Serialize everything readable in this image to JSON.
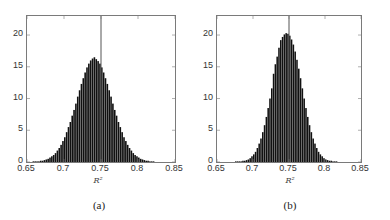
{
  "chart_data": [
    {
      "type": "bar",
      "subtype": "histogram",
      "caption": "(a)",
      "title": "",
      "xlabel": "R²",
      "ylabel": "",
      "xlim": [
        0.65,
        0.85
      ],
      "ylim": [
        0,
        23
      ],
      "xticks": [
        "0.65",
        "0.7",
        "0.75",
        "0.8",
        "0.85"
      ],
      "yticks": [
        "0",
        "5",
        "10",
        "15",
        "20"
      ],
      "grid": false,
      "reference_line_x": 0.75,
      "bin_start": 0.65,
      "bin_width": 0.0025,
      "values": [
        0.0,
        0.0,
        0.0,
        0.1,
        0.1,
        0.1,
        0.1,
        0.2,
        0.2,
        0.3,
        0.4,
        0.5,
        0.7,
        0.9,
        1.1,
        1.4,
        1.8,
        2.2,
        2.7,
        3.3,
        3.9,
        4.7,
        5.5,
        6.3,
        7.3,
        8.2,
        9.2,
        10.3,
        11.3,
        12.3,
        13.2,
        14.1,
        14.9,
        15.5,
        16.0,
        16.3,
        16.5,
        16.2,
        15.9,
        15.5,
        14.9,
        14.1,
        13.2,
        12.3,
        11.3,
        10.3,
        9.2,
        8.2,
        7.3,
        6.3,
        5.5,
        4.7,
        3.9,
        3.3,
        2.7,
        2.2,
        1.8,
        1.4,
        1.1,
        0.9,
        0.7,
        0.5,
        0.4,
        0.3,
        0.2,
        0.2,
        0.1,
        0.1,
        0.1,
        0.0,
        0.0,
        0.0,
        0.0,
        0.0,
        0.0,
        0.0,
        0.0,
        0.0,
        0.0,
        0.0
      ]
    },
    {
      "type": "bar",
      "subtype": "histogram",
      "caption": "(b)",
      "title": "",
      "xlabel": "R²",
      "ylabel": "",
      "xlim": [
        0.65,
        0.85
      ],
      "ylim": [
        0,
        23
      ],
      "xticks": [
        "0.65",
        "0.7",
        "0.75",
        "0.8",
        "0.85"
      ],
      "yticks": [
        "0",
        "5",
        "10",
        "15",
        "20"
      ],
      "grid": false,
      "reference_line_x": 0.75,
      "bin_start": 0.65,
      "bin_width": 0.0025,
      "values": [
        0.0,
        0.0,
        0.0,
        0.0,
        0.0,
        0.0,
        0.0,
        0.0,
        0.0,
        0.0,
        0.1,
        0.1,
        0.1,
        0.1,
        0.2,
        0.2,
        0.3,
        0.4,
        0.6,
        0.9,
        1.2,
        1.6,
        2.2,
        2.9,
        3.7,
        4.7,
        5.8,
        7.1,
        8.5,
        10.0,
        11.6,
        13.9,
        15.4,
        16.6,
        18.0,
        19.2,
        19.7,
        20.1,
        20.3,
        20.2,
        19.9,
        19.3,
        18.5,
        17.4,
        16.1,
        14.7,
        13.2,
        11.6,
        10.0,
        8.5,
        7.1,
        5.8,
        4.7,
        3.7,
        2.9,
        2.2,
        1.6,
        1.2,
        0.9,
        0.6,
        0.4,
        0.3,
        0.2,
        0.2,
        0.1,
        0.1,
        0.1,
        0.0,
        0.0,
        0.0,
        0.0,
        0.0,
        0.0,
        0.0,
        0.0,
        0.0,
        0.0,
        0.0,
        0.0,
        0.0
      ]
    }
  ],
  "style": {
    "bar_color": "#111111",
    "reference_line_color": "#555555",
    "axis_color": "#7a7a7a"
  }
}
